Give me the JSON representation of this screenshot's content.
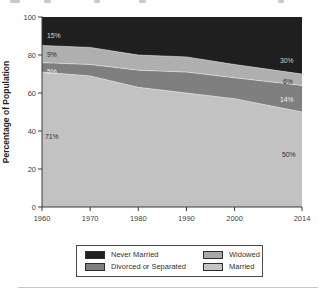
{
  "page": {
    "background": "#ffffff"
  },
  "chart_data": {
    "type": "area",
    "stacked": true,
    "title": "",
    "xlabel": "",
    "ylabel": "Percentage of Population",
    "ylim": [
      0,
      100
    ],
    "xlim": [
      1960,
      2014
    ],
    "grid": false,
    "legend_position": "bottom",
    "x": [
      1960,
      1970,
      1980,
      1990,
      2000,
      2014
    ],
    "xtick_labels": [
      "1960",
      "1970",
      "1980",
      "1990",
      "2000",
      "2014"
    ],
    "ytick_values": [
      0,
      20,
      40,
      60,
      80,
      100
    ],
    "ytick_labels": [
      "0",
      "20",
      "40",
      "60",
      "80",
      "100"
    ],
    "series": [
      {
        "name": "Married",
        "color": "#c2c2c2",
        "values": [
          71,
          69,
          63,
          60,
          57,
          50
        ]
      },
      {
        "name": "Divorced or Separated",
        "color": "#7f7f7f",
        "values": [
          5,
          6,
          9,
          11,
          11,
          14
        ]
      },
      {
        "name": "Widowed",
        "color": "#afafaf",
        "values": [
          9,
          9,
          8,
          8,
          7,
          6
        ]
      },
      {
        "name": "Never Married",
        "color": "#1f1f1f",
        "values": [
          15,
          16,
          20,
          21,
          25,
          30
        ]
      }
    ],
    "annotations": [
      {
        "text": "15%",
        "x": 47,
        "y": 38,
        "color": "#d9d9d9"
      },
      {
        "text": "9%",
        "x": 47,
        "y": 57,
        "color": "#2e2e2e"
      },
      {
        "text": "5%",
        "x": 47,
        "y": 74,
        "color": "#efefef"
      },
      {
        "text": "71%",
        "x": 45,
        "y": 139,
        "color": "#2e2e2e"
      },
      {
        "text": "30%",
        "x": 280,
        "y": 63,
        "color": "#cfcfcf"
      },
      {
        "text": "6%",
        "x": 283,
        "y": 84,
        "color": "#2e2e2e"
      },
      {
        "text": "14%",
        "x": 280,
        "y": 102,
        "color": "#efefef"
      },
      {
        "text": "50%",
        "x": 282,
        "y": 157,
        "color": "#2e2e2e"
      }
    ]
  },
  "legend": {
    "items": [
      {
        "label": "Never Married",
        "color": "#1f1f1f"
      },
      {
        "label": "Widowed",
        "color": "#a8a8a8"
      },
      {
        "label": "Divorced or Separated",
        "color": "#7f7f7f"
      },
      {
        "label": "Married",
        "color": "#c4c4c4"
      }
    ]
  },
  "axis": {
    "line_color": "#3a3a3a",
    "tick_label_color": "#3f3f3f",
    "ylabel_color": "#1e1e1e",
    "separator_color": "rgba(255,255,255,0.55)"
  },
  "artifacts": {
    "bottom_rule_color": "#c6c6c6"
  }
}
